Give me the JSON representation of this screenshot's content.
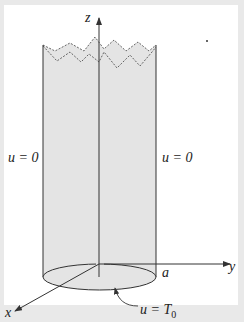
{
  "figure": {
    "axes": {
      "z_label": "z",
      "y_label": "y",
      "x_label": "x"
    },
    "labels": {
      "left_boundary": "u = 0",
      "right_boundary": "u = 0",
      "radius": "a",
      "base_condition_var": "u =",
      "base_condition_value": "T",
      "base_condition_subscript": "0"
    },
    "colors": {
      "background": "#e9e9e9",
      "frame": "#ffffff",
      "cylinder_fill": "#e4e4e4",
      "line": "#333333"
    }
  }
}
